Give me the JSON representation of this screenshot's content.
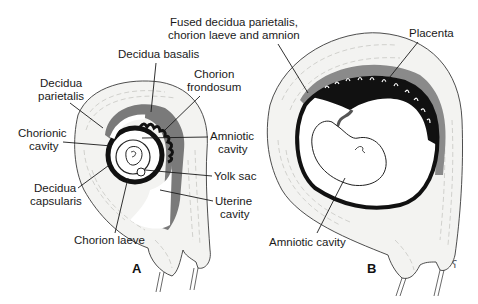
{
  "figure": {
    "panels": [
      {
        "id": "A",
        "label": "A",
        "labels": {
          "decidua_basalis": "Decidua basalis",
          "decidua_parietalis_1": "Decidua",
          "decidua_parietalis_2": "parietalis",
          "chorion_frondosum_1": "Chorion",
          "chorion_frondosum_2": "frondosum",
          "chorionic_cavity_1": "Chorionic",
          "chorionic_cavity_2": "cavity",
          "amniotic_cavity_1": "Amniotic",
          "amniotic_cavity_2": "cavity",
          "yolk_sac": "Yolk sac",
          "decidua_capsularis_1": "Decidua",
          "decidua_capsularis_2": "capsularis",
          "uterine_cavity_1": "Uterine",
          "uterine_cavity_2": "cavity",
          "chorion_laeve": "Chorion laeve"
        }
      },
      {
        "id": "B",
        "label": "B",
        "labels": {
          "fused_1": "Fused decidua parietalis,",
          "fused_2": "chorion laeve and amnion",
          "placenta": "Placenta",
          "amniotic_cavity": "Amniotic cavity"
        }
      }
    ],
    "colors": {
      "decidua_dark": "#7a7a7a",
      "chorion_black": "#111111",
      "wall_fill": "#f3f3f1",
      "ink": "#1a1a1a"
    }
  }
}
